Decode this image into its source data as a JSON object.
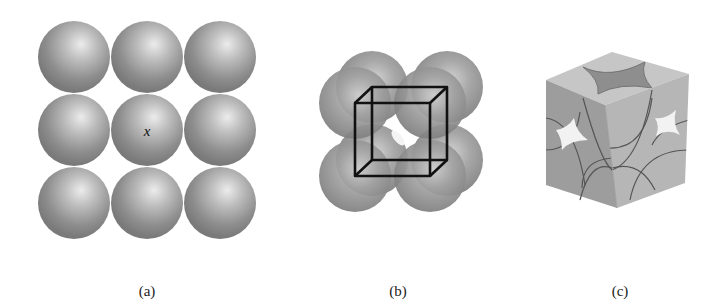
{
  "figure": {
    "panels": [
      {
        "id": "a",
        "caption": "(a)",
        "description": "Top view of simple cubic packing: 3x3 grid of identical spheres",
        "grid": {
          "rows": 3,
          "cols": 3
        },
        "center_label": "x"
      },
      {
        "id": "b",
        "caption": "(b)",
        "description": "Eight spheres at corners of a simple cubic unit cell with wireframe cube outline"
      },
      {
        "id": "c",
        "caption": "(c)",
        "description": "Space-filling simple cubic unit cell showing sphere fractions (1/8 at each corner)"
      }
    ],
    "colors": {
      "sphere_light": "#e6e6e6",
      "sphere_mid": "#a9a9a9",
      "sphere_dark": "#7b7b7b",
      "cube_outline": "#111111",
      "cube_top": "#c4c4c4",
      "cube_left": "#9c9c9c",
      "cube_right": "#b5b5b5",
      "sphere_cut": "#8c8c8c"
    }
  }
}
